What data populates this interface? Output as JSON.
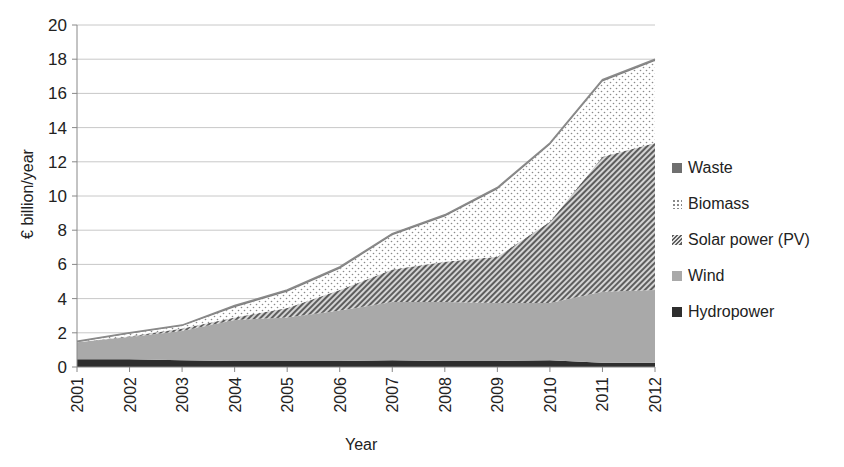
{
  "chart_data": {
    "type": "area",
    "stacked": true,
    "title": "",
    "xlabel": "Year",
    "ylabel": "€ billion/year",
    "ylim": [
      0,
      20
    ],
    "yticks": [
      0,
      2,
      4,
      6,
      8,
      10,
      12,
      14,
      16,
      18,
      20
    ],
    "grid": true,
    "legend_position": "right",
    "categories": [
      "2001",
      "2002",
      "2003",
      "2004",
      "2005",
      "2006",
      "2007",
      "2008",
      "2009",
      "2010",
      "2011",
      "2012"
    ],
    "series": [
      {
        "name": "Hydropower",
        "pattern": "solid-dark",
        "color": "#2a2a2a",
        "values": [
          0.45,
          0.45,
          0.4,
          0.35,
          0.35,
          0.35,
          0.4,
          0.35,
          0.35,
          0.4,
          0.25,
          0.25
        ]
      },
      {
        "name": "Wind",
        "pattern": "solid-gray",
        "color": "#a6a6a6",
        "values": [
          1.0,
          1.3,
          1.7,
          2.4,
          2.55,
          2.95,
          3.4,
          3.45,
          3.4,
          3.35,
          4.15,
          4.25
        ]
      },
      {
        "name": "Solar power (PV)",
        "pattern": "diagonal-hatch",
        "color": "#6e6e6e",
        "values": [
          0.0,
          0.05,
          0.15,
          0.15,
          0.55,
          1.2,
          1.9,
          2.35,
          2.7,
          4.75,
          7.9,
          8.6
        ]
      },
      {
        "name": "Biomass",
        "pattern": "dots",
        "color": "#9a9a9a",
        "values": [
          0.0,
          0.15,
          0.15,
          0.6,
          0.95,
          1.25,
          2.0,
          2.65,
          3.95,
          4.5,
          4.4,
          4.8
        ]
      },
      {
        "name": "Waste",
        "pattern": "solid-mid",
        "color": "#7a7a7a",
        "values": [
          0.05,
          0.05,
          0.05,
          0.1,
          0.1,
          0.1,
          0.1,
          0.1,
          0.1,
          0.1,
          0.1,
          0.1
        ]
      }
    ]
  },
  "axis": {
    "xlabel": "Year",
    "ylabel": "€ billion/year"
  },
  "legend": [
    {
      "label": "Waste",
      "key": "Waste"
    },
    {
      "label": "Biomass",
      "key": "Biomass"
    },
    {
      "label": "Solar power (PV)",
      "key": "Solar power (PV)"
    },
    {
      "label": "Wind",
      "key": "Wind"
    },
    {
      "label": "Hydropower",
      "key": "Hydropower"
    }
  ]
}
